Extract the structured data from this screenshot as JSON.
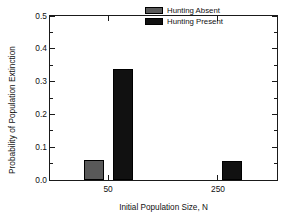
{
  "chart_data": {
    "type": "bar",
    "title": "",
    "xlabel": "Initial Population Size, N",
    "ylabel": "Probability of Population Extinction",
    "categories": [
      "50",
      "250"
    ],
    "series": [
      {
        "name": "Hunting Absent",
        "color": "#595959",
        "values": [
          0.062,
          0.0
        ]
      },
      {
        "name": "Hunting Present",
        "color": "#111111",
        "values": [
          0.338,
          0.057
        ]
      }
    ],
    "ylim": [
      0.0,
      0.5
    ],
    "ytick_labels": [
      "0.0",
      "0.1",
      "0.2",
      "0.3",
      "0.4",
      "0.5"
    ],
    "ytick_values": [
      0.0,
      0.1,
      0.2,
      0.3,
      0.4,
      0.5
    ],
    "yminor_values": [
      0.05,
      0.15,
      0.25,
      0.35,
      0.45
    ],
    "grid": false,
    "legend_position": "top-right",
    "frame": "box"
  },
  "legend": {
    "entries": [
      {
        "label": "Hunting Absent",
        "swatch_color": "#595959"
      },
      {
        "label": "Hunting Present",
        "swatch_color": "#111111"
      }
    ]
  },
  "axes": {
    "x_title": "Initial Population Size, N",
    "y_title": "Probability of Population Extinction",
    "x_tick_labels": [
      "50",
      "250"
    ],
    "y_tick_labels": [
      "0.0",
      "0.1",
      "0.2",
      "0.3",
      "0.4",
      "0.5"
    ]
  }
}
